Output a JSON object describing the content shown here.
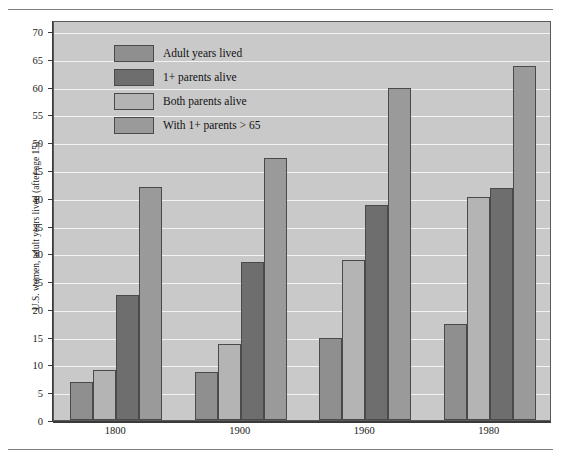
{
  "figure": {
    "top_caption": "",
    "y_axis_title": "U.S. women, adult years lived (after age 15)"
  },
  "legend": {
    "items": [
      {
        "label": "Adult years lived",
        "color": "#8f8f8f"
      },
      {
        "label": "1+ parents alive",
        "color": "#6e6e6e"
      },
      {
        "label": "Both parents alive",
        "color": "#b4b4b4"
      },
      {
        "label": "With 1+ parents > 65",
        "color": "#9a9a9a"
      }
    ]
  },
  "chart_data": {
    "type": "bar",
    "title": "",
    "xlabel": "",
    "ylabel": "U.S. women, adult years lived (after age 15)",
    "categories": [
      "1800",
      "1900",
      "1960",
      "1980"
    ],
    "ylim": [
      0,
      72
    ],
    "yticks": [
      0,
      5,
      10,
      15,
      20,
      25,
      30,
      35,
      40,
      45,
      50,
      55,
      60,
      65,
      70
    ],
    "grid": true,
    "legend_position": "top-left-inside",
    "plot_background": "#c9c9c9",
    "series": [
      {
        "name": "Adult years lived",
        "color": "#8f8f8f",
        "values": [
          6.8,
          8.6,
          14.7,
          17.3
        ]
      },
      {
        "name": "Both parents alive",
        "color": "#b4b4b4",
        "values": [
          9.0,
          13.6,
          28.8,
          40.2
        ]
      },
      {
        "name": "1+ parents alive",
        "color": "#6e6e6e",
        "values": [
          22.5,
          28.5,
          38.7,
          41.7
        ]
      },
      {
        "name": "With 1+ parents > 65",
        "color": "#9a9a9a",
        "values": [
          41.9,
          47.1,
          59.8,
          63.8
        ]
      }
    ]
  }
}
